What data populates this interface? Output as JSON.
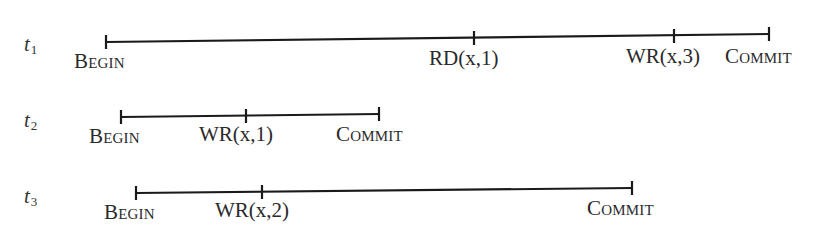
{
  "diagram": {
    "type": "transaction-timeline",
    "transactions": [
      {
        "id": "t1",
        "label_base": "t",
        "label_sub": "1",
        "events": [
          {
            "label": "Begin",
            "kind": "begin"
          },
          {
            "label": "RD(x,1)",
            "kind": "read"
          },
          {
            "label": "WR(x,3)",
            "kind": "write"
          },
          {
            "label": "Commit",
            "kind": "commit"
          }
        ]
      },
      {
        "id": "t2",
        "label_base": "t",
        "label_sub": "2",
        "events": [
          {
            "label": "Begin",
            "kind": "begin"
          },
          {
            "label": "WR(x,1)",
            "kind": "write"
          },
          {
            "label": "Commit",
            "kind": "commit"
          }
        ]
      },
      {
        "id": "t3",
        "label_base": "t",
        "label_sub": "3",
        "events": [
          {
            "label": "Begin",
            "kind": "begin"
          },
          {
            "label": "WR(x,2)",
            "kind": "write"
          },
          {
            "label": "Commit",
            "kind": "commit"
          }
        ]
      }
    ]
  }
}
